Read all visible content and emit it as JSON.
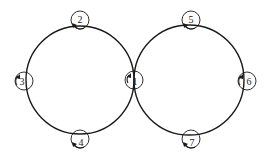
{
  "diagram": {
    "type": "two tangent rings with labeled nodes",
    "rings": [
      {
        "name": "left-ring",
        "cx": 80,
        "cy": 80,
        "r": 54
      },
      {
        "name": "right-ring",
        "cx": 189,
        "cy": 80,
        "r": 55
      }
    ],
    "nodes": [
      {
        "id": "1",
        "label": "1",
        "cx": 134,
        "cy": 80,
        "position": "tangent point between rings"
      },
      {
        "id": "2",
        "label": "2",
        "cx": 80,
        "cy": 25,
        "position": "top of left ring"
      },
      {
        "id": "3",
        "label": "3",
        "cx": 25,
        "cy": 80,
        "position": "left of left ring"
      },
      {
        "id": "4",
        "label": "4",
        "cx": 80,
        "cy": 135,
        "position": "bottom of left ring"
      },
      {
        "id": "5",
        "label": "5",
        "cx": 191,
        "cy": 25,
        "position": "top of right ring"
      },
      {
        "id": "6",
        "label": "6",
        "cx": 245,
        "cy": 80,
        "position": "right of right ring"
      },
      {
        "id": "7",
        "label": "7",
        "cx": 191,
        "cy": 135,
        "position": "bottom of right ring"
      }
    ],
    "node_radius": 9,
    "arrow_note": "each node has a small curved arrow indicating rotation direction"
  }
}
